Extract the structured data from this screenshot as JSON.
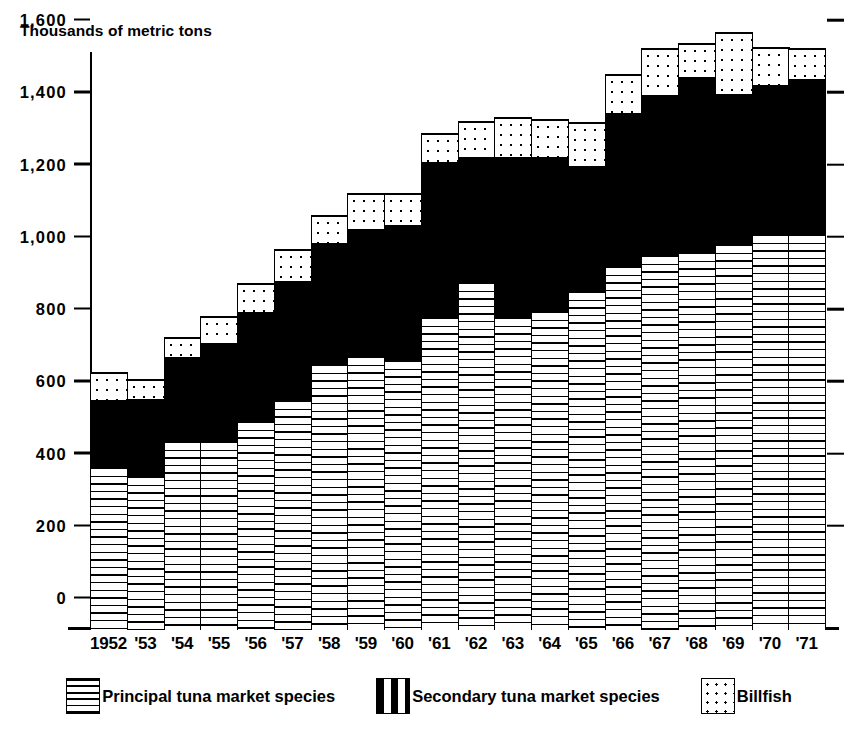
{
  "axis_title": "Thousands of metric tons",
  "legend": [
    {
      "key": "principal",
      "label": "Principal tuna market species"
    },
    {
      "key": "secondary",
      "label": "Secondary tuna market species"
    },
    {
      "key": "billfish",
      "label": "Billfish"
    }
  ],
  "chart_data": {
    "type": "bar",
    "stacked": true,
    "title": "",
    "subtitle": "",
    "xlabel": "",
    "ylabel": "Thousands of metric tons",
    "ylim": [
      0,
      1600
    ],
    "yticks": [
      0,
      200,
      400,
      600,
      800,
      1000,
      1200,
      1400,
      1600
    ],
    "ytick_labels": [
      "0",
      "200",
      "400",
      "600",
      "800",
      "1,000",
      "1,200",
      "1,400",
      "1,600"
    ],
    "grid": false,
    "legend_position": "bottom",
    "categories": [
      "1952",
      "'53",
      "'54",
      "'55",
      "'56",
      "'57",
      "'58",
      "'59",
      "'60",
      "'61",
      "'62",
      "'63",
      "'64",
      "'65",
      "'66",
      "'67",
      "'68",
      "'69",
      "'70",
      "'71"
    ],
    "series": [
      {
        "name": "Principal tuna market species",
        "values": [
          455,
          430,
          525,
          525,
          580,
          640,
          740,
          760,
          750,
          870,
          965,
          870,
          885,
          940,
          1010,
          1040,
          1050,
          1070,
          1100,
          1100
        ]
      },
      {
        "name": "Secondary tuna market species",
        "values": [
          183,
          210,
          230,
          270,
          300,
          325,
          330,
          350,
          370,
          425,
          345,
          440,
          425,
          345,
          420,
          440,
          480,
          415,
          410,
          425
        ]
      },
      {
        "name": "Billfish",
        "values": [
          75,
          55,
          55,
          75,
          80,
          90,
          80,
          100,
          90,
          80,
          100,
          110,
          105,
          120,
          110,
          130,
          95,
          170,
          105,
          85
        ]
      }
    ],
    "totals": [
      713,
      695,
      810,
      870,
      960,
      1055,
      1150,
      1210,
      1210,
      1375,
      1410,
      1420,
      1415,
      1405,
      1540,
      1610,
      1625,
      1655,
      1615,
      1610
    ]
  }
}
